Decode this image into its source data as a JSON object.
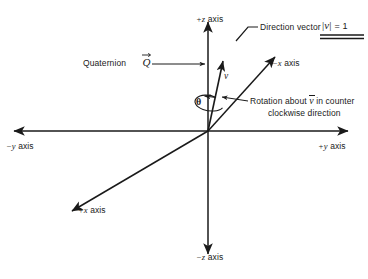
{
  "figure": {
    "type": "3d-axes-diagram",
    "background_color": "#ffffff",
    "line_color": "#1a1a1a"
  },
  "axes": {
    "plus_z": "+z axis",
    "minus_z": "−z axis",
    "plus_y": "+y axis",
    "minus_y": "−y axis",
    "plus_x": "+x axis",
    "minus_x": "−x axis"
  },
  "annotations": {
    "quaternion_label": "Quaternion",
    "quaternion_symbol": "Q",
    "direction_vector_label": "Direction vector",
    "magnitude_bar_left": "|",
    "magnitude_symbol": "v",
    "magnitude_bar_right": "|",
    "magnitude_equals": "= 1",
    "vector_label": "v",
    "angle_label": "θ",
    "rotation_line1_prefix": "Rotation about",
    "rotation_vector_symbol": "v",
    "rotation_line1_suffix": "in counter",
    "rotation_line2": "clockwise direction"
  },
  "geometry": {
    "origin": {
      "x": 208,
      "y": 131
    },
    "z_axis": {
      "top_y": 18,
      "bottom_y": 258
    },
    "y_axis": {
      "left_x": 10,
      "right_x": 352
    },
    "x_axis": {
      "plus_end": {
        "x": 68,
        "y": 214
      },
      "minus_end": {
        "x": 279,
        "y": 53
      }
    },
    "direction_vector_tip": {
      "x": 224,
      "y": 58
    },
    "angle_degrees": 28
  },
  "colors": {
    "stroke": "#1a1a1a",
    "text": "#1a1a1a",
    "background": "#ffffff"
  }
}
